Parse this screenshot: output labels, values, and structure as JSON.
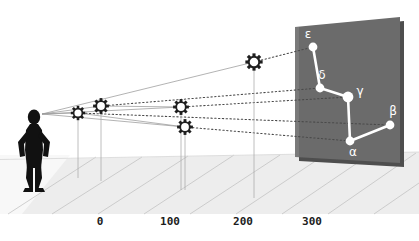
{
  "figure": {
    "title": "",
    "type": "perspective-projection-diagram",
    "background_color": "#ffffff",
    "panel_color": "#6b6b6b",
    "ground_color": "#ececec",
    "grid_line_color": "#b9b9b9",
    "sight_line_color": "#8e8e8e",
    "observer_color": "#111111",
    "star_fill_color": "#ffffff",
    "star_stroke_color": "#1c1c1c",
    "projected_star_color": "#ffffff"
  },
  "observer": {
    "name": "observer-silhouette",
    "description": "black human silhouette with hands on hips",
    "eye_point": {
      "x": 42,
      "y": 114
    }
  },
  "axis": {
    "name": "distance-axis",
    "orientation": "horizontal",
    "ticks": [
      {
        "label": "0",
        "value": 0,
        "x": 100,
        "y": 221
      },
      {
        "label": "100",
        "value": 100,
        "x": 170,
        "y": 221
      },
      {
        "label": "200",
        "value": 200,
        "x": 243,
        "y": 221
      },
      {
        "label": "300",
        "value": 300,
        "x": 312,
        "y": 221
      }
    ]
  },
  "celestial_panel": {
    "name": "projection-plane",
    "points": "295,27 400,17 400,163 295,157",
    "fill": "#6b6b6b"
  },
  "stars": [
    {
      "id": "alpha-star",
      "glyph_x": 78,
      "glyph_y": 113,
      "drop_x": 78,
      "drop_y": 178,
      "radius": 5.0
    },
    {
      "id": "gamma-star",
      "glyph_x": 101,
      "glyph_y": 106,
      "drop_x": 101,
      "drop_y": 181,
      "radius": 5.6
    },
    {
      "id": "delta-star",
      "glyph_x": 181,
      "glyph_y": 107,
      "drop_x": 181,
      "drop_y": 190,
      "radius": 5.6
    },
    {
      "id": "beta-star",
      "glyph_x": 185,
      "glyph_y": 127,
      "drop_x": 185,
      "drop_y": 190,
      "radius": 5.6
    },
    {
      "id": "epsilon-star",
      "glyph_x": 254,
      "glyph_y": 62,
      "drop_x": 254,
      "drop_y": 198,
      "radius": 6.2
    }
  ],
  "projected_stars": [
    {
      "label": "ε",
      "id": "epsilon",
      "x": 313,
      "y": 47,
      "label_x": 309,
      "label_y": 38,
      "r": 4.6
    },
    {
      "label": "δ",
      "id": "delta",
      "x": 320,
      "y": 88,
      "label_x": 322,
      "label_y": 79,
      "r": 4.6
    },
    {
      "label": "γ",
      "id": "gamma",
      "x": 348,
      "y": 97,
      "label_x": 360,
      "label_y": 94,
      "r": 5.4
    },
    {
      "label": "β",
      "id": "beta",
      "x": 390,
      "y": 125,
      "label_x": 392,
      "label_y": 115,
      "r": 4.6
    },
    {
      "label": "α",
      "id": "alpha",
      "x": 350,
      "y": 141,
      "label_x": 352,
      "label_y": 155,
      "r": 4.6
    }
  ],
  "constellation_links": [
    {
      "from": "epsilon",
      "to": "delta"
    },
    {
      "from": "delta",
      "to": "gamma"
    },
    {
      "from": "gamma",
      "to": "alpha"
    },
    {
      "from": "alpha",
      "to": "beta"
    }
  ],
  "sight_lines": [
    {
      "id": "sight-to-epsilon",
      "from_x": 42,
      "from_y": 114,
      "via_x": 254,
      "via_y": 62,
      "to_x": 313,
      "to_y": 47
    },
    {
      "id": "sight-to-delta",
      "from_x": 42,
      "from_y": 114,
      "via_x": 101,
      "via_y": 106,
      "to_x": 320,
      "to_y": 88
    },
    {
      "id": "sight-to-gamma",
      "from_x": 42,
      "from_y": 114,
      "via_x": 181,
      "via_y": 107,
      "to_x": 348,
      "to_y": 97
    },
    {
      "id": "sight-to-alpha",
      "from_x": 42,
      "from_y": 114,
      "via_x": 185,
      "via_y": 127,
      "to_x": 350,
      "to_y": 141
    },
    {
      "id": "sight-to-beta",
      "from_x": 42,
      "from_y": 114,
      "via_x": 78,
      "via_y": 113,
      "to_x": 390,
      "to_y": 125
    }
  ]
}
